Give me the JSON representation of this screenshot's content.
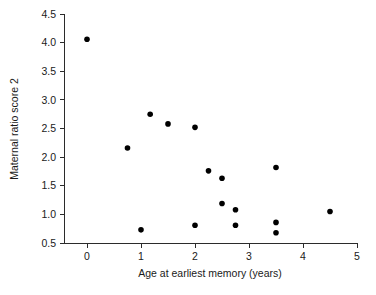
{
  "chart_data": {
    "type": "scatter",
    "title": "",
    "xlabel": "Age at earliest memory (years)",
    "ylabel": "Maternal ratio score 2",
    "xlim": [
      -0.35,
      5.15
    ],
    "ylim": [
      0.42,
      4.62
    ],
    "grid": false,
    "legend": null,
    "xticks": [
      0,
      1,
      2,
      3,
      4,
      5
    ],
    "xtick_labels": [
      "0",
      "1",
      "2",
      "3",
      "4",
      "5"
    ],
    "yticks": [
      0.5,
      1.0,
      1.5,
      2.0,
      2.5,
      3.0,
      3.5,
      4.0,
      4.5
    ],
    "ytick_labels": [
      "0.5",
      "1.0",
      "1.5",
      "2.0",
      "2.5",
      "3.0",
      "3.5",
      "4.0",
      "4.5"
    ],
    "marker": "filled-circle",
    "marker_color": "#000000",
    "marker_size_px": 5.6,
    "points": [
      {
        "x": 0.0,
        "y": 4.06
      },
      {
        "x": 0.75,
        "y": 2.16
      },
      {
        "x": 1.0,
        "y": 0.73
      },
      {
        "x": 1.17,
        "y": 2.75
      },
      {
        "x": 1.5,
        "y": 2.58
      },
      {
        "x": 2.0,
        "y": 2.52
      },
      {
        "x": 2.0,
        "y": 0.81
      },
      {
        "x": 2.25,
        "y": 1.76
      },
      {
        "x": 2.5,
        "y": 1.63
      },
      {
        "x": 2.5,
        "y": 1.19
      },
      {
        "x": 2.75,
        "y": 1.08
      },
      {
        "x": 2.75,
        "y": 0.81
      },
      {
        "x": 3.5,
        "y": 1.82
      },
      {
        "x": 3.5,
        "y": 0.86
      },
      {
        "x": 3.5,
        "y": 0.68
      },
      {
        "x": 4.5,
        "y": 1.05
      }
    ]
  },
  "colors": {
    "axis": "#2b2b2b",
    "text": "#1a1a1a",
    "marker": "#000000",
    "background": "#ffffff"
  }
}
